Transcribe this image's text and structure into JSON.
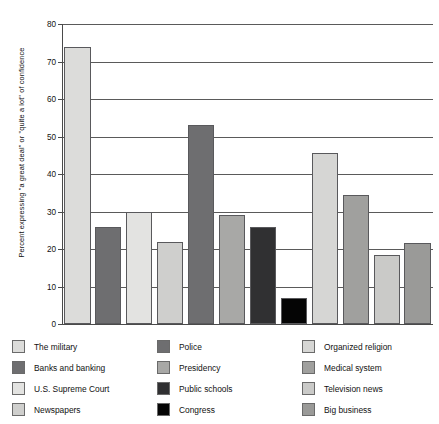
{
  "chart_data": {
    "type": "bar",
    "title": "",
    "subtitle": "",
    "xlabel": "",
    "ylabel": "Percent expressing \"a great deal\" or \"quite a lot\" of confidence",
    "ylim": [
      0,
      80
    ],
    "yticks": [
      0,
      10,
      20,
      30,
      40,
      50,
      60,
      70,
      80
    ],
    "ytick_labels": [
      "0",
      "10",
      "20",
      "30",
      "40",
      "50",
      "60",
      "70",
      "80"
    ],
    "xtick_labels": [],
    "grid": "horizontal",
    "legend_position": "below",
    "legend_columns": 3,
    "categories": [
      "The military",
      "Banks and banking",
      "U.S. Supreme Court",
      "Newspapers",
      "Police",
      "Presidency",
      "Public schools",
      "Congress",
      "Organized religion",
      "Medical system",
      "Television news",
      "Big business"
    ],
    "values": [
      74,
      26,
      30,
      22,
      53,
      29,
      26,
      7,
      45.5,
      34.5,
      18.5,
      21.5
    ],
    "colors": [
      "#dcdcda",
      "#6e6e70",
      "#e3e3e1",
      "#cfcfcd",
      "#6e6e70",
      "#a8a8a6",
      "#303032",
      "#050505",
      "#d6d6d4",
      "#a0a09e",
      "#cacac8",
      "#9a9a98"
    ]
  },
  "legend": {
    "columns": [
      {
        "items": [
          {
            "label": "The military",
            "color": "#dcdcda"
          },
          {
            "label": "Banks and banking",
            "color": "#6e6e70"
          },
          {
            "label": "U.S. Supreme Court",
            "color": "#e3e3e1"
          },
          {
            "label": "Newspapers",
            "color": "#cfcfcd"
          }
        ]
      },
      {
        "items": [
          {
            "label": "Police",
            "color": "#6e6e70"
          },
          {
            "label": "Presidency",
            "color": "#a8a8a6"
          },
          {
            "label": "Public schools",
            "color": "#303032"
          },
          {
            "label": "Congress",
            "color": "#050505"
          }
        ]
      },
      {
        "items": [
          {
            "label": "Organized religion",
            "color": "#d6d6d4"
          },
          {
            "label": "Medical system",
            "color": "#a0a09e"
          },
          {
            "label": "Television news",
            "color": "#cacac8"
          },
          {
            "label": "Big business",
            "color": "#9a9a98"
          }
        ]
      }
    ]
  }
}
